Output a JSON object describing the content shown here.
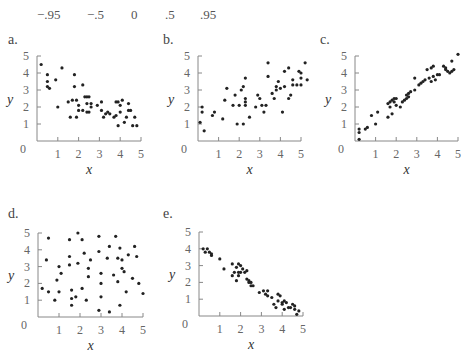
{
  "header": {
    "correlations": [
      "−.95",
      "−.5",
      "0",
      ".5",
      ".95"
    ]
  },
  "chart_data": [
    {
      "id": "a",
      "label": "a.",
      "type": "scatter",
      "xlabel": "x",
      "ylabel": "y",
      "xlim": [
        0,
        5
      ],
      "ylim": [
        0,
        5
      ],
      "xticks": [
        "1",
        "2",
        "3",
        "4",
        "5"
      ],
      "yticks": [
        "1",
        "2",
        "3",
        "4",
        "5"
      ],
      "origin_label": "0",
      "frame": {
        "x0": 37,
        "y0": 141,
        "xs": 20.8,
        "ys": 17
      },
      "points": [
        [
          0.2,
          4.5
        ],
        [
          0.5,
          3.9
        ],
        [
          0.5,
          3.5
        ],
        [
          0.5,
          3.2
        ],
        [
          0.6,
          3.1
        ],
        [
          0.9,
          3.6
        ],
        [
          1.0,
          2.0
        ],
        [
          1.2,
          4.3
        ],
        [
          1.5,
          2.3
        ],
        [
          1.6,
          1.4
        ],
        [
          1.7,
          2.4
        ],
        [
          1.8,
          3.2
        ],
        [
          1.8,
          3.9
        ],
        [
          1.9,
          1.4
        ],
        [
          1.9,
          2.4
        ],
        [
          2.0,
          2.1
        ],
        [
          2.0,
          1.8
        ],
        [
          2.2,
          3.3
        ],
        [
          2.2,
          1.8
        ],
        [
          2.3,
          2.6
        ],
        [
          2.4,
          2.6
        ],
        [
          2.4,
          2.2
        ],
        [
          2.4,
          1.7
        ],
        [
          2.5,
          2.6
        ],
        [
          2.5,
          1.7
        ],
        [
          2.6,
          2.2
        ],
        [
          2.6,
          2.0
        ],
        [
          2.9,
          2.1
        ],
        [
          3.1,
          2.3
        ],
        [
          3.1,
          1.8
        ],
        [
          3.2,
          1.4
        ],
        [
          3.3,
          1.6
        ],
        [
          3.4,
          1.7
        ],
        [
          3.5,
          1.6
        ],
        [
          3.7,
          1.4
        ],
        [
          3.8,
          2.3
        ],
        [
          3.8,
          1.5
        ],
        [
          3.9,
          2.3
        ],
        [
          3.9,
          0.9
        ],
        [
          4.0,
          1.7
        ],
        [
          4.0,
          2.1
        ],
        [
          4.1,
          2.4
        ],
        [
          4.2,
          1.1
        ],
        [
          4.3,
          1.4
        ],
        [
          4.4,
          2.2
        ],
        [
          4.4,
          1.8
        ],
        [
          4.5,
          1.8
        ],
        [
          4.6,
          0.9
        ],
        [
          4.7,
          1.4
        ],
        [
          4.8,
          0.9
        ]
      ]
    },
    {
      "id": "b",
      "label": "b.",
      "type": "scatter",
      "xlabel": "x",
      "ylabel": "y",
      "xlim": [
        0,
        5
      ],
      "ylim": [
        0,
        5
      ],
      "xticks": [
        "1",
        "2",
        "3",
        "4",
        "5"
      ],
      "yticks": [
        "1",
        "2",
        "3",
        "4",
        "5"
      ],
      "origin_label": "0",
      "frame": {
        "x0": 198,
        "y0": 141,
        "xs": 20.6,
        "ys": 17
      },
      "points": [
        [
          0.1,
          1.1
        ],
        [
          0.2,
          2.0
        ],
        [
          0.2,
          1.7
        ],
        [
          0.3,
          0.6
        ],
        [
          0.7,
          1.5
        ],
        [
          0.8,
          1.7
        ],
        [
          1.2,
          1.3
        ],
        [
          1.3,
          2.4
        ],
        [
          1.4,
          3.1
        ],
        [
          1.7,
          2.1
        ],
        [
          1.8,
          2.7
        ],
        [
          1.9,
          1.0
        ],
        [
          2.0,
          2.1
        ],
        [
          2.1,
          3.0
        ],
        [
          2.2,
          1.0
        ],
        [
          2.2,
          3.2
        ],
        [
          2.3,
          2.5
        ],
        [
          2.3,
          2.3
        ],
        [
          2.3,
          2.1
        ],
        [
          2.3,
          3.7
        ],
        [
          2.5,
          1.4
        ],
        [
          2.8,
          2.0
        ],
        [
          2.9,
          2.7
        ],
        [
          3.0,
          2.5
        ],
        [
          3.1,
          2.1
        ],
        [
          3.2,
          1.7
        ],
        [
          3.3,
          2.1
        ],
        [
          3.4,
          3.8
        ],
        [
          3.4,
          4.6
        ],
        [
          3.6,
          2.8
        ],
        [
          3.7,
          2.5
        ],
        [
          3.8,
          3.0
        ],
        [
          3.8,
          3.2
        ],
        [
          3.9,
          3.5
        ],
        [
          4.0,
          3.1
        ],
        [
          4.1,
          1.7
        ],
        [
          4.2,
          3.2
        ],
        [
          4.2,
          4.1
        ],
        [
          4.4,
          4.3
        ],
        [
          4.4,
          2.5
        ],
        [
          4.5,
          2.7
        ],
        [
          4.6,
          3.6
        ],
        [
          4.6,
          3.3
        ],
        [
          4.8,
          3.3
        ],
        [
          4.9,
          4.1
        ],
        [
          5.0,
          3.7
        ],
        [
          5.0,
          4.0
        ],
        [
          5.0,
          3.3
        ],
        [
          5.2,
          4.6
        ],
        [
          5.3,
          3.6
        ]
      ]
    },
    {
      "id": "c",
      "label": "c.",
      "type": "scatter",
      "xlabel": "x",
      "ylabel": "y",
      "xlim": [
        0,
        5
      ],
      "ylim": [
        0,
        5
      ],
      "xticks": [
        "1",
        "2",
        "3",
        "4",
        "5"
      ],
      "yticks": [
        "1",
        "2",
        "3",
        "4",
        "5"
      ],
      "origin_label": "0",
      "frame": {
        "x0": 355,
        "y0": 141,
        "xs": 20.6,
        "ys": 17
      },
      "points": [
        [
          0.2,
          0.1
        ],
        [
          0.2,
          0.5
        ],
        [
          0.2,
          0.7
        ],
        [
          0.5,
          0.7
        ],
        [
          0.6,
          0.8
        ],
        [
          0.8,
          1.5
        ],
        [
          1.0,
          1.0
        ],
        [
          1.1,
          1.7
        ],
        [
          1.6,
          1.4
        ],
        [
          1.6,
          2.2
        ],
        [
          1.7,
          2.0
        ],
        [
          1.7,
          2.3
        ],
        [
          1.8,
          2.4
        ],
        [
          1.8,
          1.6
        ],
        [
          1.9,
          2.5
        ],
        [
          1.9,
          2.3
        ],
        [
          2.0,
          2.1
        ],
        [
          2.0,
          2.5
        ],
        [
          2.2,
          2.0
        ],
        [
          2.3,
          2.3
        ],
        [
          2.4,
          2.4
        ],
        [
          2.5,
          2.5
        ],
        [
          2.5,
          2.7
        ],
        [
          2.6,
          2.6
        ],
        [
          2.6,
          2.8
        ],
        [
          2.7,
          2.9
        ],
        [
          2.9,
          3.0
        ],
        [
          2.9,
          3.7
        ],
        [
          3.1,
          3.3
        ],
        [
          3.2,
          3.4
        ],
        [
          3.3,
          3.5
        ],
        [
          3.4,
          3.6
        ],
        [
          3.5,
          4.2
        ],
        [
          3.6,
          3.7
        ],
        [
          3.7,
          4.3
        ],
        [
          3.7,
          3.5
        ],
        [
          3.8,
          4.4
        ],
        [
          3.8,
          3.8
        ],
        [
          3.9,
          3.6
        ],
        [
          4.0,
          3.9
        ],
        [
          4.1,
          3.9
        ],
        [
          4.3,
          4.4
        ],
        [
          4.4,
          4.3
        ],
        [
          4.4,
          4.2
        ],
        [
          4.5,
          4.1
        ],
        [
          4.6,
          4.0
        ],
        [
          4.7,
          4.1
        ],
        [
          4.7,
          4.7
        ],
        [
          4.8,
          4.2
        ],
        [
          5.0,
          5.1
        ]
      ]
    },
    {
      "id": "d",
      "label": "d.",
      "type": "scatter",
      "xlabel": "x",
      "ylabel": "y",
      "xlim": [
        0,
        5
      ],
      "ylim": [
        0,
        5
      ],
      "xticks": [
        "1",
        "2",
        "3",
        "4",
        "5"
      ],
      "yticks": [
        "1",
        "2",
        "3",
        "4",
        "5"
      ],
      "origin_label": "0",
      "frame": {
        "x0": 38,
        "y0": 317,
        "xs": 21,
        "ys": 16.8
      },
      "points": [
        [
          0.2,
          1.7
        ],
        [
          0.4,
          3.4
        ],
        [
          0.5,
          4.7
        ],
        [
          0.5,
          1.5
        ],
        [
          0.8,
          1.0
        ],
        [
          0.9,
          2.2
        ],
        [
          1.0,
          1.5
        ],
        [
          1.0,
          3.0
        ],
        [
          1.1,
          2.6
        ],
        [
          1.5,
          4.6
        ],
        [
          1.5,
          3.1
        ],
        [
          1.5,
          3.6
        ],
        [
          1.6,
          1.6
        ],
        [
          1.6,
          1.1
        ],
        [
          1.6,
          0.7
        ],
        [
          1.8,
          1.2
        ],
        [
          1.9,
          5.0
        ],
        [
          1.9,
          3.2
        ],
        [
          2.1,
          4.6
        ],
        [
          2.1,
          1.7
        ],
        [
          2.2,
          3.8
        ],
        [
          2.3,
          1.0
        ],
        [
          2.4,
          2.9
        ],
        [
          2.4,
          2.4
        ],
        [
          2.5,
          3.4
        ],
        [
          2.9,
          0.4
        ],
        [
          2.9,
          3.9
        ],
        [
          2.9,
          4.8
        ],
        [
          3.0,
          2.6
        ],
        [
          3.0,
          2.0
        ],
        [
          3.0,
          1.2
        ],
        [
          3.3,
          3.5
        ],
        [
          3.4,
          4.2
        ],
        [
          3.4,
          0.3
        ],
        [
          3.6,
          2.5
        ],
        [
          3.7,
          4.8
        ],
        [
          3.8,
          3.5
        ],
        [
          3.8,
          2.1
        ],
        [
          3.9,
          4.1
        ],
        [
          3.9,
          0.7
        ],
        [
          4.0,
          3.4
        ],
        [
          4.0,
          2.9
        ],
        [
          4.1,
          2.7
        ],
        [
          4.2,
          1.5
        ],
        [
          4.3,
          3.7
        ],
        [
          4.5,
          2.3
        ],
        [
          4.6,
          4.2
        ],
        [
          4.7,
          3.6
        ],
        [
          4.8,
          2.0
        ],
        [
          5.0,
          1.4
        ]
      ]
    },
    {
      "id": "e",
      "label": "e.",
      "type": "scatter",
      "xlabel": "x",
      "ylabel": "y",
      "xlim": [
        0,
        5
      ],
      "ylim": [
        0,
        5
      ],
      "xticks": [
        "1",
        "2",
        "3",
        "4",
        "5"
      ],
      "yticks": [
        "1",
        "2",
        "3",
        "4",
        "5"
      ],
      "origin_label": "0",
      "frame": {
        "x0": 199,
        "y0": 316,
        "xs": 20.8,
        "ys": 16.8
      },
      "points": [
        [
          0.2,
          4.0
        ],
        [
          0.3,
          3.8
        ],
        [
          0.4,
          4.0
        ],
        [
          0.5,
          3.8
        ],
        [
          0.6,
          3.7
        ],
        [
          0.6,
          3.6
        ],
        [
          1.0,
          3.4
        ],
        [
          1.2,
          2.8
        ],
        [
          1.6,
          3.1
        ],
        [
          1.6,
          2.4
        ],
        [
          1.7,
          2.6
        ],
        [
          1.8,
          2.9
        ],
        [
          1.8,
          2.1
        ],
        [
          1.9,
          3.1
        ],
        [
          1.9,
          2.6
        ],
        [
          1.9,
          2.4
        ],
        [
          2.0,
          3.0
        ],
        [
          2.0,
          2.6
        ],
        [
          2.1,
          2.8
        ],
        [
          2.2,
          2.6
        ],
        [
          2.3,
          2.2
        ],
        [
          2.3,
          2.7
        ],
        [
          2.4,
          2.1
        ],
        [
          2.4,
          2.0
        ],
        [
          2.5,
          1.8
        ],
        [
          2.5,
          2.0
        ],
        [
          2.6,
          1.8
        ],
        [
          2.9,
          1.4
        ],
        [
          3.1,
          1.5
        ],
        [
          3.2,
          1.3
        ],
        [
          3.3,
          1.5
        ],
        [
          3.3,
          1.2
        ],
        [
          3.5,
          1.1
        ],
        [
          3.6,
          0.7
        ],
        [
          3.7,
          0.5
        ],
        [
          3.8,
          1.3
        ],
        [
          3.8,
          0.9
        ],
        [
          3.9,
          1.2
        ],
        [
          4.0,
          0.7
        ],
        [
          4.0,
          0.8
        ],
        [
          4.1,
          0.4
        ],
        [
          4.1,
          0.9
        ],
        [
          4.2,
          0.8
        ],
        [
          4.3,
          0.5
        ],
        [
          4.4,
          0.5
        ],
        [
          4.5,
          0.7
        ],
        [
          4.6,
          0.4
        ],
        [
          4.6,
          0.6
        ],
        [
          4.7,
          0.1
        ],
        [
          4.8,
          0.3
        ]
      ]
    }
  ]
}
